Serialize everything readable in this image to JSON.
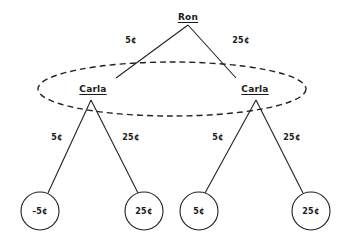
{
  "diagram": {
    "title": "",
    "type": "game-tree",
    "stroke_color": "#222222",
    "background_color": "#ffffff",
    "information_set": {
      "label": "",
      "style": "dashed-ellipse",
      "cx": 172,
      "cy": 89,
      "rx": 134,
      "ry": 27
    },
    "nodes": [
      {
        "id": "root",
        "player": "Ron",
        "label": "Ron",
        "x": 188,
        "y": 17,
        "kind": "decision"
      },
      {
        "id": "carla-l",
        "player": "Carla",
        "label": "Carla",
        "x": 93,
        "y": 89,
        "kind": "decision"
      },
      {
        "id": "carla-r",
        "player": "Carla",
        "label": "Carla",
        "x": 255,
        "y": 89,
        "kind": "decision"
      }
    ],
    "leaves": [
      {
        "id": "leaf-1",
        "label": "–5¢",
        "x": 40,
        "y": 211,
        "r": 19
      },
      {
        "id": "leaf-2",
        "label": "25¢",
        "x": 144,
        "y": 211,
        "r": 19
      },
      {
        "id": "leaf-3",
        "label": "5¢",
        "x": 199,
        "y": 211,
        "r": 19
      },
      {
        "id": "leaf-4",
        "label": "25¢",
        "x": 311,
        "y": 211,
        "r": 19
      }
    ],
    "edges": [
      {
        "id": "e-root-left",
        "from": "root",
        "to": "carla-l",
        "label": "5¢",
        "label_x": 131,
        "label_y": 40,
        "x1": 188,
        "y1": 25,
        "x2": 116,
        "y2": 78
      },
      {
        "id": "e-root-right",
        "from": "root",
        "to": "carla-r",
        "label": "25¢",
        "label_x": 241,
        "label_y": 40,
        "x1": 188,
        "y1": 25,
        "x2": 236,
        "y2": 78
      },
      {
        "id": "e-cl-left",
        "from": "carla-l",
        "to": "leaf-1",
        "label": "5¢",
        "label_x": 57,
        "label_y": 137,
        "x1": 91,
        "y1": 100,
        "x2": 48,
        "y2": 193
      },
      {
        "id": "e-cl-right",
        "from": "carla-l",
        "to": "leaf-2",
        "label": "25¢",
        "label_x": 131,
        "label_y": 137,
        "x1": 91,
        "y1": 100,
        "x2": 138,
        "y2": 193
      },
      {
        "id": "e-cr-left",
        "from": "carla-r",
        "to": "leaf-3",
        "label": "5¢",
        "label_x": 218,
        "label_y": 137,
        "x1": 256,
        "y1": 100,
        "x2": 205,
        "y2": 193
      },
      {
        "id": "e-cr-right",
        "from": "carla-r",
        "to": "leaf-4",
        "label": "25¢",
        "label_x": 292,
        "label_y": 137,
        "x1": 256,
        "y1": 100,
        "x2": 303,
        "y2": 193
      }
    ]
  }
}
